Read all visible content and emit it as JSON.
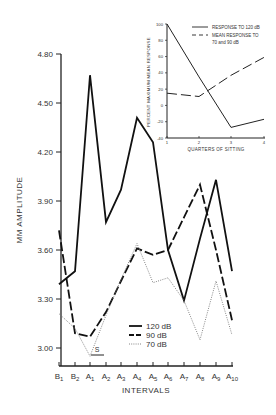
{
  "chart_data": [
    {
      "type": "line",
      "title": "",
      "xlabel": "INTERVALS",
      "ylabel": "MM AMPLITUDE",
      "categories": [
        "B1",
        "B2",
        "A1",
        "A2",
        "A3",
        "A4",
        "A5",
        "A6",
        "A7",
        "A8",
        "A9",
        "A10"
      ],
      "yticks": [
        "3.00",
        "3.30",
        "3.60",
        "3.90",
        "4.20",
        "4.50",
        "4.80"
      ],
      "ylim": [
        2.9,
        4.85
      ],
      "grid": false,
      "legend_position": "lower center",
      "annotations": [
        "S"
      ],
      "series": [
        {
          "name": "120 dB",
          "style": "solid",
          "values": [
            3.39,
            3.47,
            4.67,
            3.77,
            3.97,
            4.41,
            4.26,
            3.6,
            3.29,
            3.67,
            4.03,
            3.47
          ]
        },
        {
          "name": "90 dB",
          "style": "dashed",
          "values": [
            3.72,
            3.09,
            3.07,
            3.22,
            3.41,
            3.61,
            3.57,
            3.6,
            3.8,
            4.0,
            3.6,
            3.17
          ]
        },
        {
          "name": "70 dB",
          "style": "dotted",
          "values": [
            3.21,
            3.12,
            2.95,
            3.2,
            3.42,
            3.64,
            3.4,
            3.43,
            3.29,
            3.05,
            3.41,
            3.08
          ]
        }
      ]
    },
    {
      "type": "line",
      "title": "",
      "xlabel": "QUARTERS OF SITTING",
      "ylabel": "PERCENT MAXIMUM MEAN RESPONSE",
      "categories": [
        "1",
        "2",
        "3",
        "4"
      ],
      "yticks": [
        "-40",
        "-20",
        "0",
        "20",
        "40",
        "60",
        "80",
        "100"
      ],
      "ylim": [
        -40,
        100
      ],
      "grid": false,
      "legend_position": "upper right",
      "series": [
        {
          "name": "RESPONSE TO 120 dB",
          "style": "solid",
          "values": [
            100,
            35,
            -27,
            -17
          ]
        },
        {
          "name": "MEAN RESPONSE TO 70 and 90 dB",
          "style": "dashed",
          "values": [
            15,
            11,
            37,
            59
          ]
        }
      ]
    }
  ],
  "main": {
    "ylabel": "MM AMPLITUDE",
    "xlabel": "INTERVALS",
    "scale_marker": "S",
    "legend": [
      {
        "label": "120 dB"
      },
      {
        "label": "90 dB"
      },
      {
        "label": "70 dB"
      }
    ]
  },
  "inset": {
    "ylabel": "PERCENT MAXIMUM MEAN RESPONSE",
    "xlabel": "QUARTERS OF SITTING",
    "legend": [
      {
        "label": "RESPONSE TO 120 dB"
      },
      {
        "label_line1": "MEAN RESPONSE TO",
        "label_line2": "70 and 90 dB"
      }
    ]
  }
}
